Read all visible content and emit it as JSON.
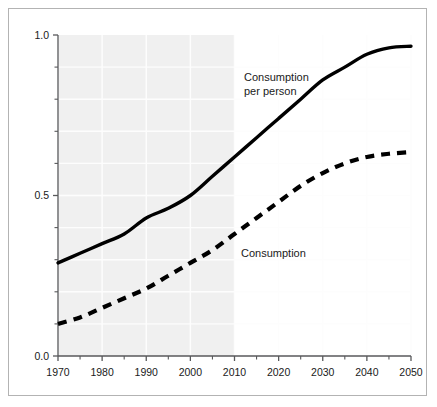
{
  "chart_data": {
    "type": "line",
    "title": "",
    "subtitle": "",
    "xlabel": "",
    "ylabel": "",
    "xlim": [
      1970,
      2050
    ],
    "ylim": [
      0.0,
      1.0
    ],
    "grid": true,
    "legend_position": "inline-annotation",
    "x_major_ticks": [
      1970,
      1980,
      1990,
      2000,
      2010,
      2020,
      2030,
      2040,
      2050
    ],
    "x_major_tick_labels": [
      "1970",
      "1980",
      "1990",
      "2000",
      "2010",
      "2020",
      "2030",
      "2040",
      "2050"
    ],
    "x_minor_ticks": [
      1975,
      1985,
      1995,
      2005,
      2015,
      2025,
      2035,
      2045
    ],
    "y_major_ticks": [
      0.0,
      0.5,
      1.0
    ],
    "y_major_tick_labels": [
      "0.0",
      "0.5",
      "1.0"
    ],
    "y_minor_ticks": [
      0.1,
      0.2,
      0.3,
      0.4,
      0.6,
      0.7,
      0.8,
      0.9
    ],
    "shaded_region": {
      "label": "historical",
      "x_start": 1970,
      "x_end": 2010,
      "color": "#f0f0f0"
    },
    "projection_region": {
      "label": "projection",
      "x_start": 2010,
      "x_end": 2050,
      "color": "#ffffff"
    },
    "series": [
      {
        "name": "Consumption per person",
        "style": "solid",
        "color": "#000000",
        "x": [
          1970,
          1975,
          1980,
          1985,
          1990,
          1995,
          2000,
          2005,
          2010,
          2015,
          2020,
          2025,
          2030,
          2035,
          2040,
          2045,
          2050
        ],
        "values": [
          0.29,
          0.32,
          0.35,
          0.38,
          0.43,
          0.46,
          0.5,
          0.56,
          0.62,
          0.68,
          0.74,
          0.8,
          0.86,
          0.9,
          0.94,
          0.96,
          0.965
        ]
      },
      {
        "name": "Consumption",
        "style": "dashed",
        "color": "#000000",
        "x": [
          1970,
          1975,
          1980,
          1985,
          1990,
          1995,
          2000,
          2005,
          2010,
          2015,
          2020,
          2025,
          2030,
          2035,
          2040,
          2045,
          2050
        ],
        "values": [
          0.1,
          0.12,
          0.15,
          0.18,
          0.21,
          0.25,
          0.29,
          0.33,
          0.38,
          0.43,
          0.48,
          0.53,
          0.57,
          0.6,
          0.62,
          0.63,
          0.635
        ]
      }
    ],
    "annotations": [
      {
        "name": "consumption-per-person-label",
        "text_line_1": "Consumption",
        "text_line_2": "per person",
        "x_px": 243,
        "y_px": 80
      },
      {
        "name": "consumption-label",
        "text_line_1": "Consumption",
        "text_line_2": "",
        "x_px": 240,
        "y_px": 256
      }
    ]
  },
  "colors": {
    "line": "#000000",
    "axis": "#58595b",
    "gridline": "#fdfdfd",
    "shaded_background": "#f0f0f0",
    "plot_background": "#ffffff",
    "frame_border": "#b3b3b3",
    "tick_label": "#1a1a1a"
  }
}
